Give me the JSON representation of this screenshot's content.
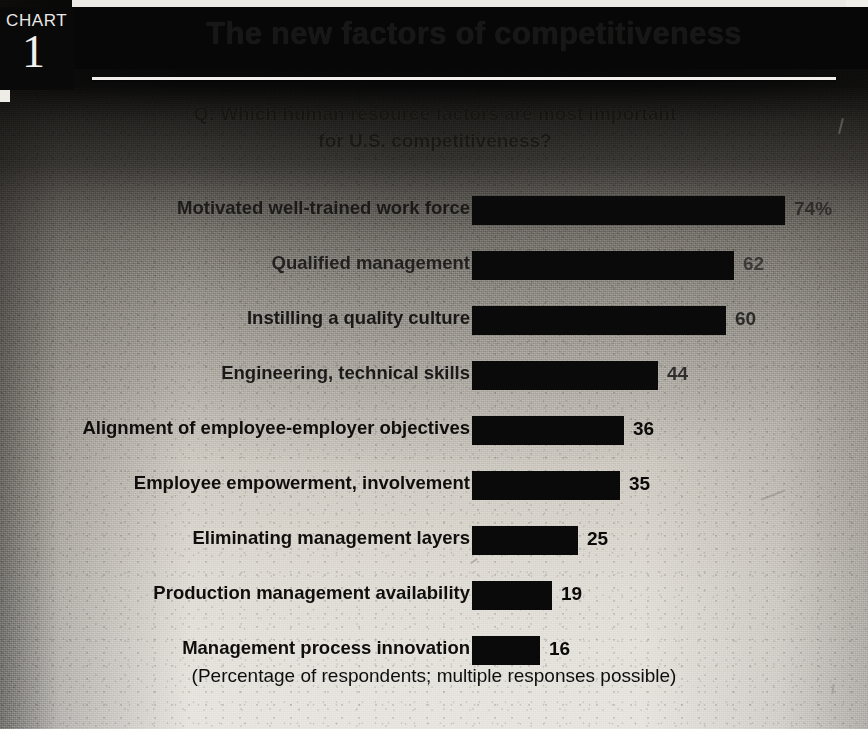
{
  "badge": {
    "word": "CHART",
    "number": "1"
  },
  "title": "The new factors of competitiveness",
  "subtitle_line1": "Q: Which human resource factors are most important",
  "subtitle_line2": "for U.S. competitiveness?",
  "footnote": "(Percentage of respondents; multiple responses possible)",
  "chart_data": {
    "type": "bar",
    "orientation": "horizontal",
    "title": "The new factors of competitiveness",
    "subtitle": "Q: Which human resource factors are most important for U.S. competitiveness?",
    "xlabel": "",
    "ylabel": "",
    "xlim": [
      0,
      80
    ],
    "grid": false,
    "legend": null,
    "value_suffix": "",
    "note": "(Percentage of respondents; multiple responses possible)",
    "categories": [
      "Motivated well-trained work force",
      "Qualified management",
      "Instilling a quality culture",
      "Engineering, technical skills",
      "Alignment of employee-employer objectives",
      "Employee empowerment, involvement",
      "Eliminating management layers",
      "Production management availability",
      "Management process innovation"
    ],
    "values": [
      74,
      62,
      60,
      44,
      36,
      35,
      25,
      19,
      16
    ],
    "value_labels": [
      "74%",
      "62",
      "60",
      "44",
      "36",
      "35",
      "25",
      "19",
      "16"
    ],
    "bar_color": "#0a0a0a"
  }
}
